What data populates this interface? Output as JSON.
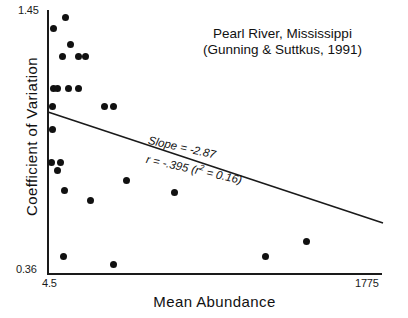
{
  "chart_data": {
    "type": "scatter",
    "title": "Pearl River,  Mississippi",
    "subtitle": "(Gunning & Suttkus, 1991)",
    "xlabel": "Mean  Abundance",
    "ylabel": "Coefficient  of  Variation",
    "xlim": [
      4.5,
      1775
    ],
    "ylim": [
      0.36,
      1.45
    ],
    "xticks": [
      "4.5",
      "1775"
    ],
    "yticks": [
      "0.36",
      "1.45"
    ],
    "grid": false,
    "legend": null,
    "xscale": "log",
    "annotations": [
      "Slope = -2.87",
      "r = -.395  (r² = 0.16)"
    ],
    "slope": -2.87,
    "r": -0.395,
    "r_squared": 0.16,
    "marker_color": "#111111",
    "line_color": "#1a1a1a",
    "n_points": 25,
    "points": [
      {
        "x": 22,
        "y": 1.44
      },
      {
        "x": 9,
        "y": 1.39
      },
      {
        "x": 26,
        "y": 1.33
      },
      {
        "x": 18,
        "y": 1.29
      },
      {
        "x": 33,
        "y": 1.29
      },
      {
        "x": 40,
        "y": 1.29
      },
      {
        "x": 11,
        "y": 1.13
      },
      {
        "x": 14,
        "y": 1.13
      },
      {
        "x": 24,
        "y": 1.13
      },
      {
        "x": 37,
        "y": 1.13
      },
      {
        "x": 10,
        "y": 1.05
      },
      {
        "x": 95,
        "y": 1.05
      },
      {
        "x": 120,
        "y": 1.05
      },
      {
        "x": 11,
        "y": 0.97
      },
      {
        "x": 11,
        "y": 0.855
      },
      {
        "x": 18,
        "y": 0.855
      },
      {
        "x": 15,
        "y": 0.825
      },
      {
        "x": 220,
        "y": 0.79
      },
      {
        "x": 19,
        "y": 0.74
      },
      {
        "x": 50,
        "y": 0.7
      },
      {
        "x": 600,
        "y": 0.735
      },
      {
        "x": 25,
        "y": 0.46
      },
      {
        "x": 105,
        "y": 0.435
      },
      {
        "x": 960,
        "y": 0.46
      },
      {
        "x": 1400,
        "y": 0.52
      }
    ],
    "pixel_points": [
      {
        "px": 65,
        "py": 17
      },
      {
        "px": 53,
        "py": 28
      },
      {
        "px": 70,
        "py": 44
      },
      {
        "px": 62,
        "py": 56
      },
      {
        "px": 78,
        "py": 56
      },
      {
        "px": 85,
        "py": 56
      },
      {
        "px": 53,
        "py": 88
      },
      {
        "px": 57,
        "py": 88
      },
      {
        "px": 68,
        "py": 88
      },
      {
        "px": 78,
        "py": 88
      },
      {
        "px": 52,
        "py": 106
      },
      {
        "px": 104,
        "py": 106
      },
      {
        "px": 113,
        "py": 106
      },
      {
        "px": 52,
        "py": 129
      },
      {
        "px": 51,
        "py": 162
      },
      {
        "px": 60,
        "py": 162
      },
      {
        "px": 57,
        "py": 170
      },
      {
        "px": 126,
        "py": 180
      },
      {
        "px": 64,
        "py": 190
      },
      {
        "px": 90,
        "py": 200
      },
      {
        "px": 174,
        "py": 192
      },
      {
        "px": 63,
        "py": 256
      },
      {
        "px": 113,
        "py": 264
      },
      {
        "px": 265,
        "py": 256
      },
      {
        "px": 306,
        "py": 241
      }
    ],
    "regression_line": {
      "x1_px": 48,
      "y1_px": 112,
      "x2_px": 383,
      "y2_px": 223
    }
  }
}
